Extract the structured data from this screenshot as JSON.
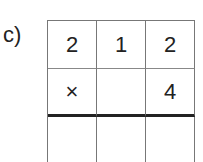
{
  "label": "c)",
  "grid": {
    "rows": [
      [
        "2",
        "1",
        "2"
      ],
      [
        "×",
        "",
        "4"
      ],
      [
        "",
        "",
        ""
      ]
    ]
  }
}
